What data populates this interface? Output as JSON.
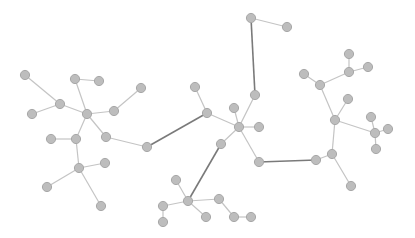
{
  "graph": {
    "width": 415,
    "height": 238,
    "background": "#ffffff",
    "node_fill": "#bdbdbd",
    "node_stroke": "#a8a8a8",
    "node_radius": 4.6,
    "edge_light_color": "#c4c4c4",
    "edge_dark_color": "#7a7a7a",
    "nodes": [
      {
        "id": "n0",
        "x": 25,
        "y": 75
      },
      {
        "id": "n1",
        "x": 75,
        "y": 79
      },
      {
        "id": "n2",
        "x": 99,
        "y": 81
      },
      {
        "id": "n3",
        "x": 60,
        "y": 104
      },
      {
        "id": "n4",
        "x": 32,
        "y": 114
      },
      {
        "id": "n5",
        "x": 87,
        "y": 114
      },
      {
        "id": "n6",
        "x": 114,
        "y": 111
      },
      {
        "id": "n7",
        "x": 141,
        "y": 88
      },
      {
        "id": "n8",
        "x": 106,
        "y": 137
      },
      {
        "id": "n9",
        "x": 147,
        "y": 147
      },
      {
        "id": "n10",
        "x": 51,
        "y": 139
      },
      {
        "id": "n11",
        "x": 76,
        "y": 139
      },
      {
        "id": "n12",
        "x": 105,
        "y": 163
      },
      {
        "id": "n13",
        "x": 79,
        "y": 168
      },
      {
        "id": "n14",
        "x": 47,
        "y": 187
      },
      {
        "id": "n15",
        "x": 101,
        "y": 206
      },
      {
        "id": "n16",
        "x": 195,
        "y": 87
      },
      {
        "id": "n17",
        "x": 207,
        "y": 113
      },
      {
        "id": "n18",
        "x": 234,
        "y": 108
      },
      {
        "id": "n19",
        "x": 239,
        "y": 127
      },
      {
        "id": "n20",
        "x": 259,
        "y": 127
      },
      {
        "id": "n21",
        "x": 255,
        "y": 95
      },
      {
        "id": "n22",
        "x": 251,
        "y": 18
      },
      {
        "id": "n23",
        "x": 287,
        "y": 27
      },
      {
        "id": "n24",
        "x": 221,
        "y": 144
      },
      {
        "id": "n25",
        "x": 259,
        "y": 162
      },
      {
        "id": "n26",
        "x": 176,
        "y": 180
      },
      {
        "id": "n27",
        "x": 188,
        "y": 201
      },
      {
        "id": "n28",
        "x": 219,
        "y": 199
      },
      {
        "id": "n29",
        "x": 163,
        "y": 206
      },
      {
        "id": "n30",
        "x": 206,
        "y": 217
      },
      {
        "id": "n31",
        "x": 163,
        "y": 222
      },
      {
        "id": "n32",
        "x": 234,
        "y": 217
      },
      {
        "id": "n33",
        "x": 251,
        "y": 217
      },
      {
        "id": "n34",
        "x": 349,
        "y": 54
      },
      {
        "id": "n35",
        "x": 304,
        "y": 74
      },
      {
        "id": "n36",
        "x": 320,
        "y": 85
      },
      {
        "id": "n37",
        "x": 349,
        "y": 72
      },
      {
        "id": "n38",
        "x": 368,
        "y": 67
      },
      {
        "id": "n39",
        "x": 348,
        "y": 99
      },
      {
        "id": "n40",
        "x": 335,
        "y": 120
      },
      {
        "id": "n41",
        "x": 371,
        "y": 117
      },
      {
        "id": "n42",
        "x": 375,
        "y": 133
      },
      {
        "id": "n43",
        "x": 388,
        "y": 129
      },
      {
        "id": "n44",
        "x": 376,
        "y": 149
      },
      {
        "id": "n45",
        "x": 332,
        "y": 154
      },
      {
        "id": "n46",
        "x": 316,
        "y": 160
      },
      {
        "id": "n47",
        "x": 351,
        "y": 186
      }
    ],
    "edges": [
      {
        "from": "n0",
        "to": "n3",
        "style": "light"
      },
      {
        "from": "n1",
        "to": "n2",
        "style": "light"
      },
      {
        "from": "n1",
        "to": "n5",
        "style": "light"
      },
      {
        "from": "n3",
        "to": "n4",
        "style": "light"
      },
      {
        "from": "n3",
        "to": "n5",
        "style": "light"
      },
      {
        "from": "n5",
        "to": "n6",
        "style": "light"
      },
      {
        "from": "n6",
        "to": "n7",
        "style": "light"
      },
      {
        "from": "n5",
        "to": "n8",
        "style": "light"
      },
      {
        "from": "n8",
        "to": "n9",
        "style": "light"
      },
      {
        "from": "n5",
        "to": "n11",
        "style": "light"
      },
      {
        "from": "n10",
        "to": "n11",
        "style": "light"
      },
      {
        "from": "n11",
        "to": "n13",
        "style": "light"
      },
      {
        "from": "n12",
        "to": "n13",
        "style": "light"
      },
      {
        "from": "n13",
        "to": "n14",
        "style": "light"
      },
      {
        "from": "n13",
        "to": "n15",
        "style": "light"
      },
      {
        "from": "n9",
        "to": "n17",
        "style": "dark"
      },
      {
        "from": "n16",
        "to": "n17",
        "style": "light"
      },
      {
        "from": "n17",
        "to": "n19",
        "style": "light"
      },
      {
        "from": "n18",
        "to": "n19",
        "style": "light"
      },
      {
        "from": "n19",
        "to": "n20",
        "style": "light"
      },
      {
        "from": "n19",
        "to": "n21",
        "style": "light"
      },
      {
        "from": "n21",
        "to": "n22",
        "style": "dark"
      },
      {
        "from": "n22",
        "to": "n23",
        "style": "light"
      },
      {
        "from": "n19",
        "to": "n24",
        "style": "light"
      },
      {
        "from": "n19",
        "to": "n25",
        "style": "light"
      },
      {
        "from": "n24",
        "to": "n27",
        "style": "dark"
      },
      {
        "from": "n26",
        "to": "n27",
        "style": "light"
      },
      {
        "from": "n27",
        "to": "n28",
        "style": "light"
      },
      {
        "from": "n27",
        "to": "n29",
        "style": "light"
      },
      {
        "from": "n27",
        "to": "n30",
        "style": "light"
      },
      {
        "from": "n29",
        "to": "n31",
        "style": "light"
      },
      {
        "from": "n28",
        "to": "n32",
        "style": "light"
      },
      {
        "from": "n32",
        "to": "n33",
        "style": "light"
      },
      {
        "from": "n25",
        "to": "n46",
        "style": "dark"
      },
      {
        "from": "n46",
        "to": "n45",
        "style": "light"
      },
      {
        "from": "n45",
        "to": "n47",
        "style": "light"
      },
      {
        "from": "n45",
        "to": "n40",
        "style": "light"
      },
      {
        "from": "n40",
        "to": "n39",
        "style": "light"
      },
      {
        "from": "n40",
        "to": "n36",
        "style": "light"
      },
      {
        "from": "n35",
        "to": "n36",
        "style": "light"
      },
      {
        "from": "n36",
        "to": "n37",
        "style": "light"
      },
      {
        "from": "n37",
        "to": "n34",
        "style": "light"
      },
      {
        "from": "n37",
        "to": "n38",
        "style": "light"
      },
      {
        "from": "n40",
        "to": "n42",
        "style": "light"
      },
      {
        "from": "n41",
        "to": "n42",
        "style": "light"
      },
      {
        "from": "n42",
        "to": "n43",
        "style": "light"
      },
      {
        "from": "n42",
        "to": "n44",
        "style": "light"
      }
    ]
  }
}
